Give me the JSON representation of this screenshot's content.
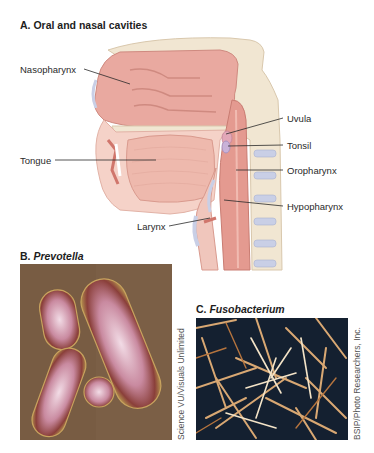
{
  "panel_a": {
    "letter": "A.",
    "title": "Oral and nasal cavities",
    "labels": {
      "nasopharynx": "Nasopharynx",
      "uvula": "Uvula",
      "tonsil": "Tonsil",
      "tongue": "Tongue",
      "oropharynx": "Oropharynx",
      "hypopharynx": "Hypopharynx",
      "larynx": "Larynx"
    }
  },
  "panel_b": {
    "letter": "B.",
    "title": "Prevotella",
    "credit": "Science VU/Visuals Unlimited"
  },
  "panel_c": {
    "letter": "C.",
    "title": "Fusobacterium",
    "credit": "BSIP/Photo Researchers, Inc."
  },
  "colors": {
    "tissue_pink": "#e9a9a0",
    "tissue_light": "#f5d2c8",
    "bone": "#f1e6d2",
    "cartilage_blue": "#c9cfe6",
    "prevotella_bg": "#7a5e45",
    "fuso_bg": "#14202e",
    "fiber": "#d9a873"
  }
}
